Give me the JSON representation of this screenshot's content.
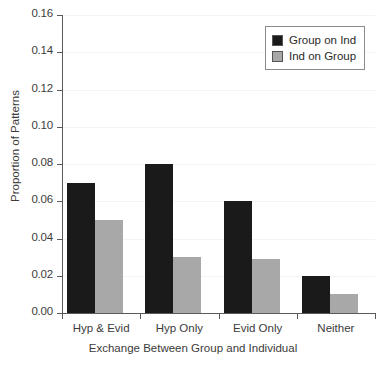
{
  "chart_data": {
    "type": "bar",
    "title": "",
    "xlabel": "Exchange Between Group and Individual",
    "ylabel": "Proportion of Patterns",
    "categories": [
      "Hyp & Evid",
      "Hyp Only",
      "Evid Only",
      "Neither"
    ],
    "series": [
      {
        "name": "Group on Ind",
        "color": "#1a1a1a",
        "values": [
          0.07,
          0.08,
          0.06,
          0.02
        ]
      },
      {
        "name": "Ind on Group",
        "color": "#a8a8a8",
        "values": [
          0.05,
          0.03,
          0.029,
          0.01
        ]
      }
    ],
    "ylim": [
      0.0,
      0.16
    ],
    "ytick_step": 0.02,
    "yticks": [
      "0.16",
      "0.14",
      "0.12",
      "0.10",
      "0.08",
      "0.06",
      "0.04",
      "0.02",
      "0.00"
    ],
    "ytick_values": [
      0.16,
      0.14,
      0.12,
      0.1,
      0.08,
      0.06,
      0.04,
      0.02,
      0.0
    ],
    "grid": true,
    "legend_position": "top-right"
  }
}
